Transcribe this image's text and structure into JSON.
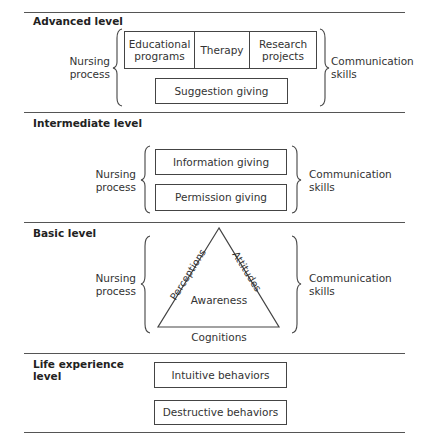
{
  "diagram": {
    "levels": [
      {
        "id": "advanced",
        "heading": "Advanced level",
        "left_label_line1": "Nursing",
        "left_label_line2": "process",
        "right_label_line1": "Communication",
        "right_label_line2": "skills",
        "row_boxes": [
          {
            "line1": "Educational",
            "line2": "programs"
          },
          {
            "line1": "Therapy",
            "line2": ""
          },
          {
            "line1": "Research",
            "line2": "projects"
          }
        ],
        "boxes": [
          "Suggestion giving"
        ]
      },
      {
        "id": "intermediate",
        "heading": "Intermediate level",
        "left_label_line1": "Nursing",
        "left_label_line2": "process",
        "right_label_line1": "Communication",
        "right_label_line2": "skills",
        "boxes": [
          "Information giving",
          "Permission giving"
        ]
      },
      {
        "id": "basic",
        "heading": "Basic level",
        "left_label_line1": "Nursing",
        "left_label_line2": "process",
        "right_label_line1": "Communication",
        "right_label_line2": "skills",
        "triangle": {
          "center": "Awareness",
          "left_side": "Perceptions",
          "right_side": "Attitudes",
          "bottom_side": "Cognitions"
        }
      },
      {
        "id": "life-experience",
        "heading_line1": "Life experience",
        "heading_line2": "level",
        "boxes": [
          "Intuitive behaviors",
          "Destructive behaviors"
        ]
      }
    ]
  }
}
